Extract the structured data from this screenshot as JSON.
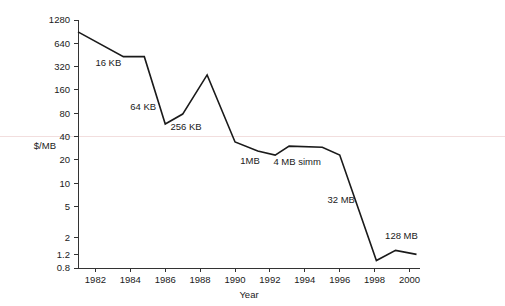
{
  "chart_data": {
    "type": "line",
    "title": "",
    "xlabel": "Year",
    "ylabel": "$/MB",
    "yscale": "log",
    "xlim": [
      1981.0,
      2000.6
    ],
    "ylim": [
      0.8,
      1280
    ],
    "grid": false,
    "legend": "none",
    "y_ticks": [
      {
        "value": 1280,
        "label": "1280"
      },
      {
        "value": 640,
        "label": "640"
      },
      {
        "value": 320,
        "label": "320"
      },
      {
        "value": 160,
        "label": "160"
      },
      {
        "value": 80,
        "label": "80"
      },
      {
        "value": 40,
        "label": "40"
      },
      {
        "value": 20,
        "label": "20"
      },
      {
        "value": 10,
        "label": "10"
      },
      {
        "value": 5,
        "label": "5"
      },
      {
        "value": 2,
        "label": "2"
      },
      {
        "value": 1.2,
        "label": "1.2"
      },
      {
        "value": 0.8,
        "label": "0.8"
      }
    ],
    "x_ticks": [
      {
        "value": 1982,
        "label": "1982"
      },
      {
        "value": 1984,
        "label": "1984"
      },
      {
        "value": 1986,
        "label": "1986"
      },
      {
        "value": 1988,
        "label": "1988"
      },
      {
        "value": 1990,
        "label": "1990"
      },
      {
        "value": 1992,
        "label": "1992"
      },
      {
        "value": 1994,
        "label": "1994"
      },
      {
        "value": 1996,
        "label": "1996"
      },
      {
        "value": 1998,
        "label": "1998"
      },
      {
        "value": 2000,
        "label": "2000"
      }
    ],
    "series": [
      {
        "name": "DRAM price",
        "color": "#1a1a1a",
        "x": [
          1981.0,
          1983.6,
          1984.8,
          1986.0,
          1987.0,
          1988.4,
          1990.0,
          1991.3,
          1992.3,
          1993.1,
          1995.0,
          1996.0,
          1998.1,
          1999.2,
          2000.4
        ],
        "values": [
          900,
          430,
          430,
          58,
          78,
          250,
          34,
          26,
          23,
          30,
          29,
          23,
          1.0,
          1.35,
          1.2
        ]
      }
    ],
    "annotations": [
      {
        "text": "16 KB",
        "x": 1982.0,
        "y": 330
      },
      {
        "text": "64 KB",
        "x": 1984.0,
        "y": 88
      },
      {
        "text": "256 KB",
        "x": 1986.3,
        "y": 48
      },
      {
        "text": "1MB",
        "x": 1990.3,
        "y": 17.5
      },
      {
        "text": "4 MB simm",
        "x": 1992.2,
        "y": 17.0
      },
      {
        "text": "32 MB",
        "x": 1995.3,
        "y": 5.5
      },
      {
        "text": "128 MB",
        "x": 1998.6,
        "y": 1.9
      }
    ]
  },
  "layout": {
    "plot_left": 78,
    "plot_right": 420,
    "plot_bottom": 268,
    "plot_top": 20
  }
}
